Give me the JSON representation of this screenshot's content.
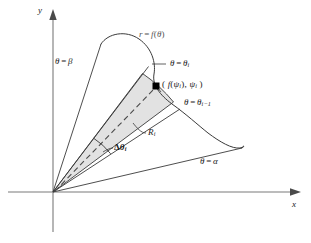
{
  "figure": {
    "background_color": "#ffffff",
    "stroke_color": "#3a3a3a",
    "axis_color": "#6b6b6b",
    "sector_fill_color": "#e2e2e2",
    "curve_label_color": "#666666",
    "point_marker_color": "#000000"
  },
  "axes": {
    "y_label": "y",
    "x_label": "x",
    "origin": {
      "x": 53,
      "y": 192
    }
  },
  "labels": {
    "curve": {
      "r": "r",
      "equals": "=",
      "f": "f",
      "open": "(",
      "theta": "θ",
      "close": ")"
    },
    "theta_beta": {
      "theta": "θ",
      "equals": "=",
      "value": "β"
    },
    "theta_alpha": {
      "theta": "θ",
      "equals": "=",
      "value": "α"
    },
    "theta_i": {
      "theta": "θ",
      "equals": "=",
      "value": "θ",
      "sub": "i"
    },
    "theta_i_minus_1": {
      "theta": "θ",
      "equals": "=",
      "value": "θ",
      "sub": "i−1"
    },
    "point": {
      "open": "( ",
      "f": "f",
      "arg_open": "(",
      "psi": "ψ",
      "psi_sub": "i",
      "arg_close": ")",
      "comma": ", ",
      "psi2": "ψ",
      "psi2_sub": "i",
      "close": " )"
    },
    "region": {
      "letter": "R",
      "sub": "i"
    },
    "delta_theta": {
      "delta": "Δ",
      "theta": "θ",
      "sub": "i"
    }
  },
  "geometry": {
    "sector_inner_vertex": {
      "x": 53,
      "y": 192
    },
    "sector_point": {
      "x": 156,
      "y": 86
    },
    "arc_mark_note": "small arc near origin indicating the angular width",
    "dashed_ray_note": "dashed bisector from origin through the sample point"
  }
}
